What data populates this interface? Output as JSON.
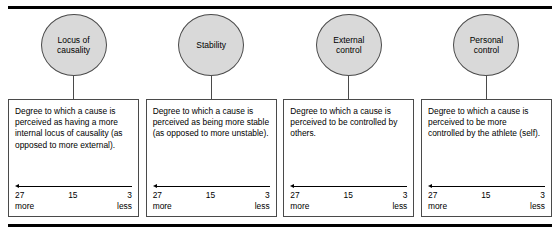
{
  "figure": {
    "top_rule": "",
    "bottom_rule": ""
  },
  "columns": [
    {
      "node_label": "Locus of\ncausality",
      "description": "Degree to which a cause is perceived as having a more internal locus of causality (as opposed to more external).",
      "scale": {
        "high": "27",
        "mid": "15",
        "low": "3",
        "left_label": "more",
        "right_label": "less"
      }
    },
    {
      "node_label": "Stability",
      "description": "Degree to which a cause is perceived as being more stable (as opposed to more unstable).",
      "scale": {
        "high": "27",
        "mid": "15",
        "low": "3",
        "left_label": "more",
        "right_label": "less"
      }
    },
    {
      "node_label": "External\ncontrol",
      "description": "Degree to which a cause is perceived to be controlled by others.",
      "scale": {
        "high": "27",
        "mid": "15",
        "low": "3",
        "left_label": "more",
        "right_label": "less"
      }
    },
    {
      "node_label": "Personal\ncontrol",
      "description": "Degree to which a cause is perceived to be more controlled by the athlete (self).",
      "scale": {
        "high": "27",
        "mid": "15",
        "low": "3",
        "left_label": "more",
        "right_label": "less"
      }
    }
  ],
  "colors": {
    "node_fill": "#d9d9d9",
    "stroke": "#4a4a4a",
    "rule": "#000000",
    "text": "#000000"
  }
}
